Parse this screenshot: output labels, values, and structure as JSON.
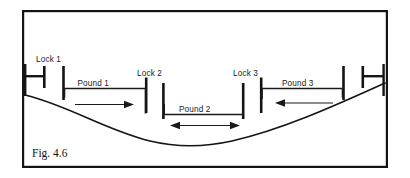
{
  "figure": {
    "caption": "Fig. 4.6"
  },
  "colors": {
    "ink": "#141414",
    "line": "#1a1a1a",
    "background": "#ffffff"
  },
  "locks": [
    {
      "id": "lock-1",
      "label": "Lock 1",
      "label_x": 36,
      "label_y": 60
    },
    {
      "id": "lock-2",
      "label": "Lock 2",
      "label_x": 138,
      "label_y": 74
    },
    {
      "id": "lock-3",
      "label": "Lock 3",
      "label_x": 234,
      "label_y": 74
    }
  ],
  "pounds": [
    {
      "id": "pound-1",
      "label": "Pound 1",
      "label_x": 78,
      "label_y": 84,
      "flow": "right"
    },
    {
      "id": "pound-2",
      "label": "Pound 2",
      "label_x": 180,
      "label_y": 110,
      "flow": "both"
    },
    {
      "id": "pound-3",
      "label": "Pound 3",
      "label_x": 283,
      "label_y": 84,
      "flow": "left"
    }
  ],
  "frame": {
    "x": 22,
    "y": 10,
    "width": 366,
    "height": 158
  }
}
